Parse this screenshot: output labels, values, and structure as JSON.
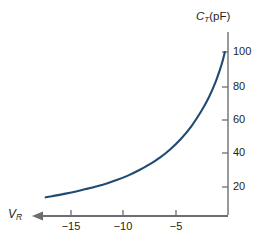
{
  "chart_data": {
    "type": "line",
    "title": "",
    "subtitle": "",
    "xlabel": "VR",
    "xlabel_base": "V",
    "xlabel_sub": "R",
    "ylabel": "CT (pF)",
    "ylabel_base": "C",
    "ylabel_sub": "T",
    "ylabel_unit": "(pF)",
    "xlim": [
      -17.5,
      0
    ],
    "ylim": [
      0,
      105
    ],
    "grid": false,
    "legend": null,
    "x_direction_note": "axis increases to the right toward 0; arrow points left toward more negative VR",
    "xticks": [
      -15,
      -10,
      -5
    ],
    "xtick_labels": [
      "−15",
      "−10",
      "−5"
    ],
    "yticks": [
      20,
      40,
      60,
      80,
      100
    ],
    "ytick_labels": [
      "20",
      "40",
      "60",
      "80",
      "100"
    ],
    "series": [
      {
        "name": "CT",
        "color": "#214a73",
        "x": [
          -17.4,
          -16.5,
          -15.5,
          -14.5,
          -13.5,
          -12.5,
          -11.5,
          -10.5,
          -9.5,
          -8.5,
          -7.5,
          -6.5,
          -5.5,
          -4.5,
          -3.5,
          -2.5,
          -1.8,
          -1.2,
          -0.8,
          -0.5,
          -0.3
        ],
        "y": [
          14,
          15,
          16.2,
          17.5,
          19,
          20.6,
          22.4,
          24.5,
          27,
          30,
          33.5,
          37.5,
          42.5,
          48.5,
          56,
          65.5,
          73.5,
          82,
          89,
          95,
          100
        ]
      }
    ],
    "axis_color": "#6d6e71",
    "curve_color": "#214a73",
    "arrow_direction": "left"
  },
  "yaxis": {
    "labels": [
      "100",
      "80",
      "60",
      "40",
      "20"
    ]
  },
  "xaxis": {
    "labels": [
      "−15",
      "−10",
      "−5"
    ]
  }
}
